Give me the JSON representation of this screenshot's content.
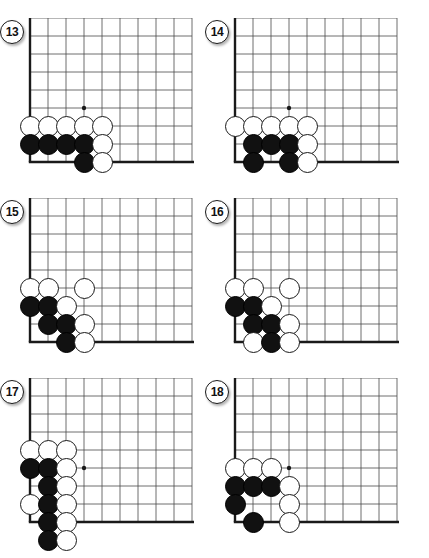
{
  "page": {
    "kind": "go-problem-diagrams",
    "width": 429,
    "height": 558,
    "background": "#ffffff",
    "line_color": "#4a4a4a",
    "edge_color": "#1a1a1a",
    "black_stone_color": "#111111",
    "white_stone_color": "#ffffff"
  },
  "layout": {
    "columns": 2,
    "rows": 3,
    "cell_size": 18,
    "stone_diameter": 21,
    "panel_origins": [
      {
        "x": 12,
        "y": 18
      },
      {
        "x": 217,
        "y": 18
      },
      {
        "x": 12,
        "y": 198
      },
      {
        "x": 217,
        "y": 198
      },
      {
        "x": 12,
        "y": 378
      },
      {
        "x": 217,
        "y": 378
      }
    ]
  },
  "diagrams": [
    {
      "label": "13",
      "badge_label": "13",
      "name": "diagram-13",
      "board": {
        "cols": 10,
        "rows": 9,
        "left_edge_col": 1,
        "bottom_edge_row": 8,
        "star_points": [
          {
            "col": 4,
            "row": 5
          }
        ]
      },
      "stones": [
        {
          "color": "white",
          "col": 1,
          "row": 6
        },
        {
          "color": "white",
          "col": 2,
          "row": 6
        },
        {
          "color": "white",
          "col": 3,
          "row": 6
        },
        {
          "color": "white",
          "col": 4,
          "row": 6
        },
        {
          "color": "white",
          "col": 5,
          "row": 6
        },
        {
          "color": "black",
          "col": 1,
          "row": 7
        },
        {
          "color": "black",
          "col": 2,
          "row": 7
        },
        {
          "color": "black",
          "col": 3,
          "row": 7
        },
        {
          "color": "black",
          "col": 4,
          "row": 7
        },
        {
          "color": "white",
          "col": 5,
          "row": 7
        },
        {
          "color": "black",
          "col": 4,
          "row": 8
        },
        {
          "color": "white",
          "col": 5,
          "row": 8
        }
      ]
    },
    {
      "label": "14",
      "badge_label": "14",
      "name": "diagram-14",
      "board": {
        "cols": 10,
        "rows": 9,
        "left_edge_col": 1,
        "bottom_edge_row": 8,
        "star_points": [
          {
            "col": 4,
            "row": 5
          }
        ]
      },
      "stones": [
        {
          "color": "white",
          "col": 1,
          "row": 6
        },
        {
          "color": "white",
          "col": 2,
          "row": 6
        },
        {
          "color": "white",
          "col": 3,
          "row": 6
        },
        {
          "color": "white",
          "col": 4,
          "row": 6
        },
        {
          "color": "white",
          "col": 5,
          "row": 6
        },
        {
          "color": "black",
          "col": 2,
          "row": 7
        },
        {
          "color": "black",
          "col": 3,
          "row": 7
        },
        {
          "color": "black",
          "col": 4,
          "row": 7
        },
        {
          "color": "white",
          "col": 5,
          "row": 7
        },
        {
          "color": "black",
          "col": 2,
          "row": 8
        },
        {
          "color": "black",
          "col": 4,
          "row": 8
        },
        {
          "color": "white",
          "col": 5,
          "row": 8
        }
      ]
    },
    {
      "label": "15",
      "badge_label": "15",
      "name": "diagram-15",
      "board": {
        "cols": 10,
        "rows": 9,
        "left_edge_col": 1,
        "bottom_edge_row": 8,
        "star_points": []
      },
      "stones": [
        {
          "color": "white",
          "col": 1,
          "row": 5
        },
        {
          "color": "white",
          "col": 2,
          "row": 5
        },
        {
          "color": "white",
          "col": 4,
          "row": 5
        },
        {
          "color": "black",
          "col": 1,
          "row": 6
        },
        {
          "color": "black",
          "col": 2,
          "row": 6
        },
        {
          "color": "white",
          "col": 3,
          "row": 6
        },
        {
          "color": "black",
          "col": 2,
          "row": 7
        },
        {
          "color": "black",
          "col": 3,
          "row": 7
        },
        {
          "color": "white",
          "col": 4,
          "row": 7
        },
        {
          "color": "black",
          "col": 3,
          "row": 8
        },
        {
          "color": "white",
          "col": 4,
          "row": 8
        }
      ]
    },
    {
      "label": "16",
      "badge_label": "16",
      "name": "diagram-16",
      "board": {
        "cols": 10,
        "rows": 9,
        "left_edge_col": 1,
        "bottom_edge_row": 8,
        "star_points": []
      },
      "stones": [
        {
          "color": "white",
          "col": 1,
          "row": 5
        },
        {
          "color": "white",
          "col": 2,
          "row": 5
        },
        {
          "color": "white",
          "col": 4,
          "row": 5
        },
        {
          "color": "black",
          "col": 1,
          "row": 6
        },
        {
          "color": "black",
          "col": 2,
          "row": 6
        },
        {
          "color": "white",
          "col": 3,
          "row": 6
        },
        {
          "color": "black",
          "col": 2,
          "row": 7
        },
        {
          "color": "black",
          "col": 3,
          "row": 7
        },
        {
          "color": "white",
          "col": 4,
          "row": 7
        },
        {
          "color": "white",
          "col": 2,
          "row": 8
        },
        {
          "color": "black",
          "col": 3,
          "row": 8
        },
        {
          "color": "white",
          "col": 4,
          "row": 8
        }
      ]
    },
    {
      "label": "17",
      "badge_label": "17",
      "name": "diagram-17",
      "board": {
        "cols": 10,
        "rows": 9,
        "left_edge_col": 1,
        "bottom_edge_row": 8,
        "star_points": [
          {
            "col": 4,
            "row": 5
          }
        ]
      },
      "stones": [
        {
          "color": "white",
          "col": 1,
          "row": 4
        },
        {
          "color": "white",
          "col": 2,
          "row": 4
        },
        {
          "color": "white",
          "col": 3,
          "row": 4
        },
        {
          "color": "black",
          "col": 1,
          "row": 5
        },
        {
          "color": "black",
          "col": 2,
          "row": 5
        },
        {
          "color": "white",
          "col": 3,
          "row": 5
        },
        {
          "color": "black",
          "col": 2,
          "row": 6
        },
        {
          "color": "white",
          "col": 3,
          "row": 6
        },
        {
          "color": "white",
          "col": 1,
          "row": 7
        },
        {
          "color": "black",
          "col": 2,
          "row": 7
        },
        {
          "color": "white",
          "col": 3,
          "row": 7
        },
        {
          "color": "black",
          "col": 2,
          "row": 8
        },
        {
          "color": "white",
          "col": 3,
          "row": 8
        },
        {
          "color": "black",
          "col": 2,
          "row": 9
        },
        {
          "color": "white",
          "col": 3,
          "row": 9
        }
      ]
    },
    {
      "label": "18",
      "badge_label": "18",
      "name": "diagram-18",
      "board": {
        "cols": 10,
        "rows": 9,
        "left_edge_col": 1,
        "bottom_edge_row": 8,
        "star_points": [
          {
            "col": 4,
            "row": 5
          }
        ]
      },
      "stones": [
        {
          "color": "white",
          "col": 1,
          "row": 5
        },
        {
          "color": "white",
          "col": 2,
          "row": 5
        },
        {
          "color": "white",
          "col": 3,
          "row": 5
        },
        {
          "color": "black",
          "col": 1,
          "row": 6
        },
        {
          "color": "black",
          "col": 2,
          "row": 6
        },
        {
          "color": "black",
          "col": 3,
          "row": 6
        },
        {
          "color": "white",
          "col": 4,
          "row": 6
        },
        {
          "color": "black",
          "col": 1,
          "row": 7
        },
        {
          "color": "white",
          "col": 4,
          "row": 7
        },
        {
          "color": "black",
          "col": 2,
          "row": 8
        },
        {
          "color": "white",
          "col": 4,
          "row": 8
        }
      ]
    }
  ]
}
